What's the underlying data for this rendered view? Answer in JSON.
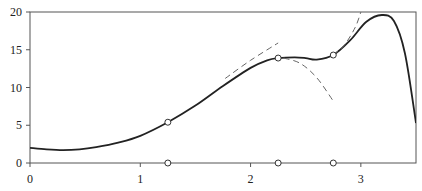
{
  "chart_data": {
    "type": "line",
    "title": "",
    "xlabel": "",
    "ylabel": "",
    "xlim": [
      0,
      3.5
    ],
    "ylim": [
      0,
      20
    ],
    "grid": false,
    "x_ticks": [
      "0",
      "1",
      "2",
      "3"
    ],
    "y_ticks": [
      "0",
      "5",
      "10",
      "15",
      "20"
    ],
    "series": [
      {
        "name": "function",
        "style": "solid",
        "x": [
          0,
          0.15,
          0.3,
          0.45,
          0.6,
          0.8,
          1.0,
          1.25,
          1.5,
          1.75,
          2.0,
          2.15,
          2.25,
          2.4,
          2.5,
          2.6,
          2.75,
          2.9,
          3.05,
          3.19,
          3.3,
          3.4,
          3.5
        ],
        "y": [
          2.0,
          1.8,
          1.7,
          1.8,
          2.1,
          2.7,
          3.6,
          5.4,
          7.6,
          10.2,
          12.6,
          13.6,
          13.9,
          14.0,
          13.9,
          13.7,
          14.3,
          16.2,
          18.7,
          19.6,
          18.8,
          14.5,
          5.3
        ]
      },
      {
        "name": "local approximation at 2.25",
        "style": "dashed",
        "x": [
          1.77,
          2.0,
          2.25
        ],
        "y": [
          11.2,
          13.6,
          15.9
        ]
      },
      {
        "name": "local approximation at 2.75 (lower)",
        "style": "dashed",
        "x": [
          2.3,
          2.45,
          2.6,
          2.75
        ],
        "y": [
          13.9,
          13.2,
          11.3,
          8.2
        ]
      },
      {
        "name": "local approximation at 2.75 (upper)",
        "style": "dashed",
        "x": [
          2.75,
          2.85,
          2.95,
          3.0
        ],
        "y": [
          14.3,
          15.6,
          18.0,
          20.0
        ]
      }
    ],
    "markers": {
      "on_curve": [
        {
          "x": 1.25,
          "y": 5.4
        },
        {
          "x": 2.25,
          "y": 13.9
        },
        {
          "x": 2.75,
          "y": 14.3
        }
      ],
      "on_axis": [
        {
          "x": 1.25,
          "y": 0
        },
        {
          "x": 2.25,
          "y": 0
        },
        {
          "x": 2.75,
          "y": 0
        }
      ]
    }
  }
}
